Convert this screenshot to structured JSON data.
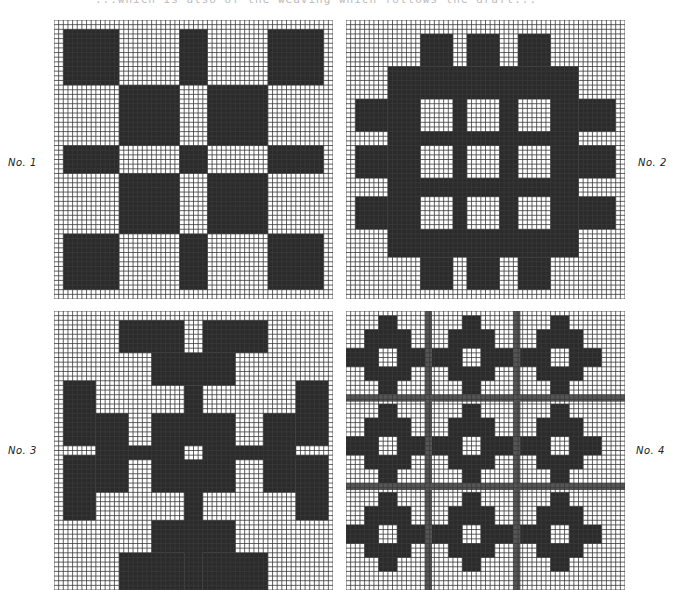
{
  "page": {
    "caption_partial": "...which is also of the weaving which follows the draft..."
  },
  "colors": {
    "dark": "#2b2b2b",
    "grid": "#3a3a3a",
    "paper": "#ffffff",
    "hatch": "#555555"
  },
  "grid": {
    "cells": 60,
    "cell_px": 4.65
  },
  "panels": [
    {
      "label": "No. 1",
      "x": 54,
      "y": 20,
      "label_x": 8,
      "label_y": 157,
      "bands": [
        [
          2,
          14
        ],
        [
          14,
          27
        ],
        [
          27,
          33
        ],
        [
          33,
          46
        ],
        [
          46,
          58
        ]
      ],
      "rects": []
    },
    {
      "label": "No. 2",
      "x": 346,
      "y": 20,
      "label_x": 638,
      "label_y": 157,
      "rects": [
        [
          9,
          10,
          41,
          41
        ],
        [
          16,
          3,
          7,
          7
        ],
        [
          26,
          3,
          7,
          7
        ],
        [
          37,
          3,
          7,
          7
        ],
        [
          16,
          51,
          7,
          7
        ],
        [
          26,
          51,
          7,
          7
        ],
        [
          37,
          51,
          7,
          7
        ],
        [
          2,
          17,
          7,
          7
        ],
        [
          2,
          27,
          7,
          7
        ],
        [
          2,
          38,
          7,
          7
        ],
        [
          50,
          17,
          8,
          7
        ],
        [
          50,
          27,
          8,
          7
        ],
        [
          50,
          38,
          8,
          7
        ]
      ],
      "holes": [
        [
          16,
          17,
          7,
          7
        ],
        [
          26,
          17,
          7,
          7
        ],
        [
          37,
          17,
          7,
          7
        ],
        [
          16,
          27,
          7,
          7
        ],
        [
          26,
          27,
          7,
          7
        ],
        [
          37,
          27,
          7,
          7
        ],
        [
          16,
          38,
          7,
          7
        ],
        [
          26,
          38,
          7,
          7
        ],
        [
          37,
          38,
          7,
          7
        ]
      ]
    },
    {
      "label": "No. 3",
      "x": 54,
      "y": 311,
      "label_x": 8,
      "label_y": 445,
      "rects": [
        [
          14,
          2,
          14,
          7
        ],
        [
          32,
          2,
          14,
          7
        ],
        [
          21,
          9,
          18,
          7
        ],
        [
          28,
          16,
          4,
          44
        ],
        [
          21,
          22,
          18,
          17
        ],
        [
          9,
          29,
          43,
          3
        ],
        [
          2,
          15,
          7,
          14
        ],
        [
          2,
          31,
          7,
          14
        ],
        [
          9,
          22,
          7,
          17
        ],
        [
          52,
          15,
          7,
          14
        ],
        [
          52,
          31,
          7,
          14
        ],
        [
          45,
          22,
          7,
          17
        ],
        [
          21,
          45,
          18,
          7
        ],
        [
          14,
          52,
          14,
          8
        ],
        [
          32,
          52,
          14,
          8
        ]
      ],
      "holes": [
        [
          28,
          29,
          4,
          3
        ]
      ]
    },
    {
      "label": "No. 4",
      "x": 346,
      "y": 311,
      "label_x": 636,
      "label_y": 445,
      "motif_origins": [
        [
          0,
          1
        ],
        [
          18,
          1
        ],
        [
          37,
          1
        ],
        [
          0,
          20
        ],
        [
          18,
          20
        ],
        [
          37,
          20
        ],
        [
          0,
          39
        ],
        [
          18,
          39
        ],
        [
          37,
          39
        ]
      ],
      "motif_rects": [
        [
          7,
          0,
          4,
          17
        ],
        [
          4,
          3,
          10,
          11
        ],
        [
          0,
          7,
          18,
          4
        ]
      ],
      "motif_holes": [
        [
          7,
          7,
          4,
          4
        ]
      ],
      "hatch_lines_v": [
        17,
        36
      ],
      "hatch_lines_h": [
        18,
        37
      ]
    }
  ]
}
